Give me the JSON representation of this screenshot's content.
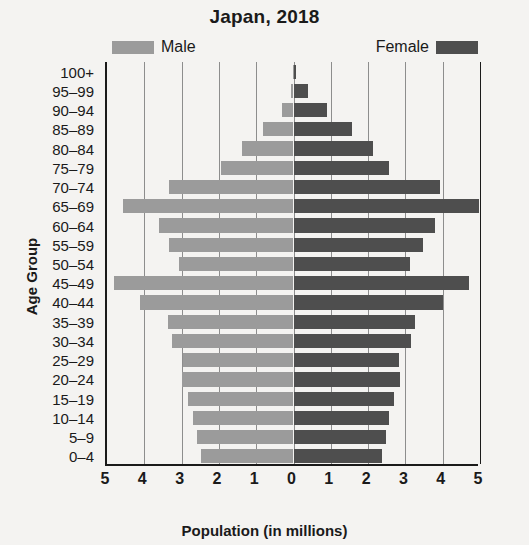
{
  "chart_data": {
    "type": "bar",
    "subtype": "population-pyramid",
    "title": "Japan, 2018",
    "xlabel": "Population (in millions)",
    "ylabel": "Age Group",
    "xlim": [
      -5,
      5
    ],
    "xticks": [
      "5",
      "4",
      "3",
      "2",
      "1",
      "0",
      "1",
      "2",
      "3",
      "4",
      "5"
    ],
    "xtick_values": [
      -5,
      -4,
      -3,
      -2,
      -1,
      0,
      1,
      2,
      3,
      4,
      5
    ],
    "grid": true,
    "legend_position": "top",
    "categories": [
      "100+",
      "95–99",
      "90–94",
      "85–89",
      "80–84",
      "75–79",
      "70–74",
      "65–69",
      "60–64",
      "55–59",
      "50–54",
      "45–49",
      "40–44",
      "35–39",
      "30–34",
      "25–29",
      "20–24",
      "15–19",
      "10–14",
      "5–9",
      "0–4"
    ],
    "series": [
      {
        "name": "Male",
        "color": "#9b9b9b",
        "side": "left",
        "values": [
          0.01,
          0.08,
          0.32,
          0.82,
          1.38,
          1.94,
          3.35,
          4.57,
          3.61,
          3.35,
          3.07,
          4.8,
          4.12,
          3.37,
          3.27,
          2.96,
          2.99,
          2.84,
          2.7,
          2.6,
          2.48
        ]
      },
      {
        "name": "Female",
        "color": "#4e4e4e",
        "side": "right",
        "values": [
          0.06,
          0.38,
          0.9,
          1.58,
          2.12,
          2.55,
          3.94,
          4.97,
          3.8,
          3.48,
          3.13,
          4.7,
          4.02,
          3.25,
          3.14,
          2.84,
          2.86,
          2.7,
          2.57,
          2.47,
          2.36
        ]
      }
    ]
  },
  "legend": {
    "male_label": "Male",
    "female_label": "Female"
  },
  "colors": {
    "male": "#9b9b9b",
    "female": "#4e4e4e",
    "axis": "#1a1a1a",
    "grid": "#8d8d8d",
    "background": "#f4f3f1"
  }
}
